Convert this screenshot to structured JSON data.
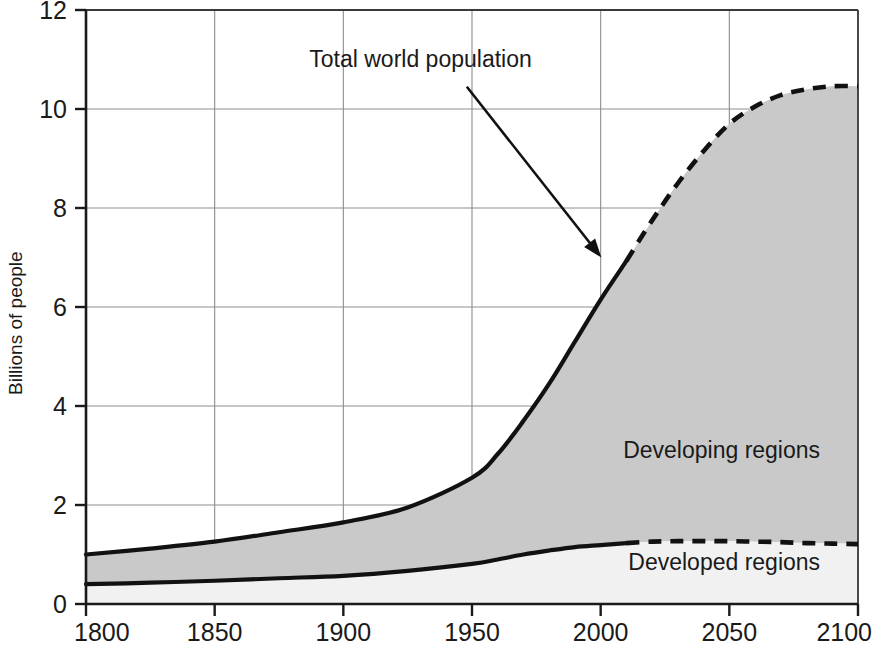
{
  "chart_data": {
    "type": "area",
    "title": "",
    "subtitle": "",
    "xlabel": "",
    "ylabel": "Billions of people",
    "xlim": [
      1800,
      2100
    ],
    "ylim": [
      0,
      12
    ],
    "grid": true,
    "legend_position": "inline-annotations",
    "x_ticks": [
      "1800",
      "1850",
      "1900",
      "1950",
      "2000",
      "2050",
      "2100"
    ],
    "y_ticks": [
      "0",
      "2",
      "4",
      "6",
      "8",
      "10",
      "12"
    ],
    "x": [
      1800,
      1825,
      1850,
      1875,
      1900,
      1925,
      1950,
      1960,
      1970,
      1980,
      1990,
      2000,
      2010,
      2020,
      2030,
      2040,
      2050,
      2060,
      2070,
      2080,
      2090,
      2100
    ],
    "historical_projection_split_year": 2010,
    "series": [
      {
        "name": "Total world population",
        "style": "solid-then-dashed",
        "values": [
          1.0,
          1.12,
          1.26,
          1.45,
          1.65,
          1.95,
          2.55,
          3.03,
          3.7,
          4.45,
          5.3,
          6.15,
          6.93,
          7.75,
          8.5,
          9.15,
          9.7,
          10.05,
          10.28,
          10.4,
          10.46,
          10.46
        ]
      },
      {
        "name": "Developed regions",
        "style": "solid-then-dashed",
        "values": [
          0.4,
          0.43,
          0.47,
          0.52,
          0.57,
          0.67,
          0.81,
          0.9,
          1.0,
          1.08,
          1.15,
          1.19,
          1.23,
          1.26,
          1.27,
          1.27,
          1.27,
          1.26,
          1.25,
          1.23,
          1.22,
          1.21
        ]
      }
    ],
    "bands": [
      {
        "name": "Developing regions",
        "between": [
          "Developed regions",
          "Total world population"
        ],
        "fill": "#c9c9c9"
      },
      {
        "name": "Developed regions",
        "between": [
          "baseline",
          "Developed regions"
        ],
        "fill": "#f1f1f1"
      }
    ],
    "annotations": [
      {
        "text": "Total world population",
        "text_x": 1930,
        "text_y": 10.85,
        "arrow_from_x": 1948,
        "arrow_from_y": 10.45,
        "arrow_to_x": 2001,
        "arrow_to_y": 6.95
      },
      {
        "text": "Developing regions",
        "text_x": 2047,
        "text_y": 2.95
      },
      {
        "text": "Developed regions",
        "text_x": 2048,
        "text_y": 0.68
      }
    ],
    "colors": {
      "developing_fill": "#c9c9c9",
      "developed_fill": "#f1f1f1",
      "curve": "#111111",
      "grid": "#8d8d8d",
      "axis": "#1a1a1a",
      "background": "#ffffff"
    }
  },
  "axes": {
    "y_title": "Billions of people"
  },
  "labels": {
    "total_world_population": "Total world population",
    "developing_regions": "Developing regions",
    "developed_regions": "Developed regions"
  }
}
